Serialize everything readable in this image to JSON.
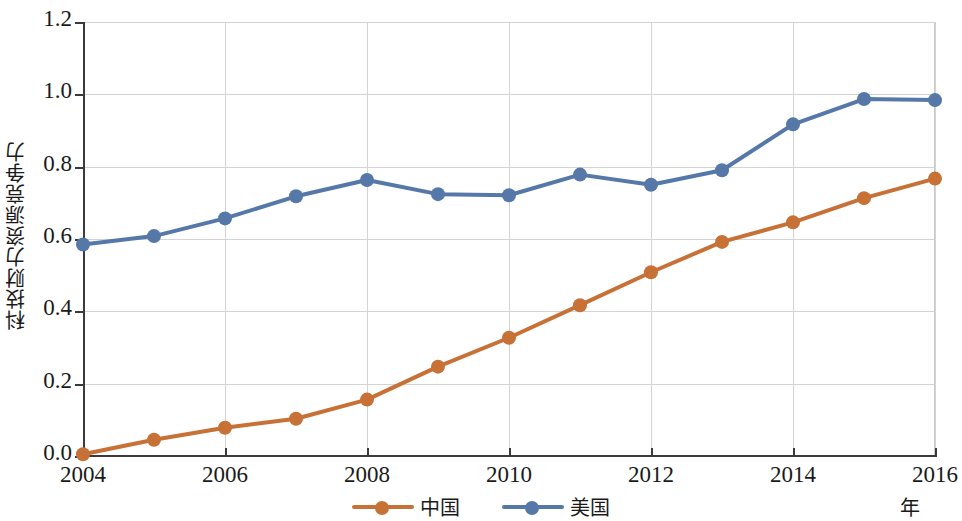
{
  "chart_data": {
    "type": "line",
    "title": "",
    "xlabel": "年",
    "ylabel": "科技财力资源竞争力",
    "x": [
      2004,
      2005,
      2006,
      2007,
      2008,
      2009,
      2010,
      2011,
      2012,
      2013,
      2014,
      2015,
      2016
    ],
    "xlim": [
      2004,
      2016
    ],
    "ylim": [
      0.0,
      1.2
    ],
    "x_tick_labels": [
      "2004",
      "2006",
      "2008",
      "2010",
      "2012",
      "2014",
      "2016"
    ],
    "x_tick_values": [
      2004,
      2006,
      2008,
      2010,
      2012,
      2014,
      2016
    ],
    "y_tick_labels": [
      "0.0",
      "0.2",
      "0.4",
      "0.6",
      "0.8",
      "1.0",
      "1.2"
    ],
    "y_tick_values": [
      0.0,
      0.2,
      0.4,
      0.6,
      0.8,
      1.0,
      1.2
    ],
    "grid": true,
    "legend_position": "bottom-center",
    "series": [
      {
        "name": "中国",
        "color": "#c87137",
        "marker": "circle",
        "values": [
          0.005,
          0.045,
          0.078,
          0.103,
          0.156,
          0.247,
          0.327,
          0.417,
          0.508,
          0.592,
          0.646,
          0.713,
          0.767
        ]
      },
      {
        "name": "美国",
        "color": "#5578a8",
        "marker": "circle",
        "values": [
          0.585,
          0.608,
          0.657,
          0.718,
          0.763,
          0.724,
          0.721,
          0.778,
          0.75,
          0.79,
          0.917,
          0.987,
          0.984
        ]
      }
    ]
  },
  "legend": {
    "items": [
      {
        "label": "中国",
        "color": "#c87137"
      },
      {
        "label": "美国",
        "color": "#5578a8"
      }
    ]
  },
  "axes": {
    "y_title": "科技财力资源竞争力",
    "x_unit": "年"
  },
  "colors": {
    "china_orange": "#c87137",
    "usa_blue": "#5578a8",
    "gridline": "#d4d4d4",
    "axis": "#3a3a3a",
    "text": "#1a1a1a",
    "background": "#ffffff"
  }
}
